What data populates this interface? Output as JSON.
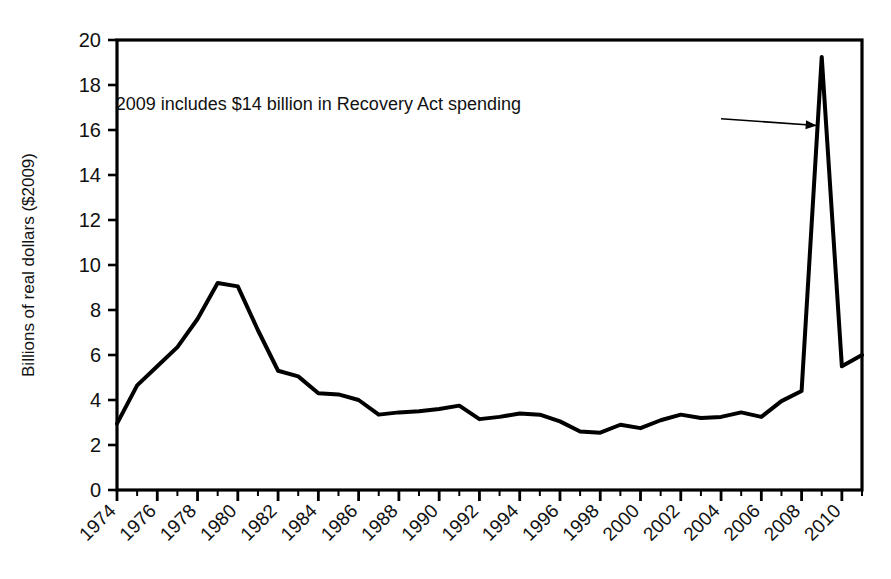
{
  "chart_data": {
    "type": "line",
    "title": "",
    "subtitle": "",
    "xlabel": "",
    "ylabel": "Billions of real dollars ($2009)",
    "xlim": [
      1974,
      2011
    ],
    "ylim": [
      0,
      20
    ],
    "grid": false,
    "legend": null,
    "legend_position": "none",
    "y_ticks": [
      0,
      2,
      4,
      6,
      8,
      10,
      12,
      14,
      16,
      18,
      20
    ],
    "y_tick_labels": [
      "0",
      "2",
      "4",
      "6",
      "8",
      "10",
      "12",
      "14",
      "16",
      "18",
      "20"
    ],
    "y_tick_step": 2,
    "x_ticks": [
      1974,
      1975,
      1976,
      1977,
      1978,
      1979,
      1980,
      1981,
      1982,
      1983,
      1984,
      1985,
      1986,
      1987,
      1988,
      1989,
      1990,
      1991,
      1992,
      1993,
      1994,
      1995,
      1996,
      1997,
      1998,
      1999,
      2000,
      2001,
      2002,
      2003,
      2004,
      2005,
      2006,
      2007,
      2008,
      2009,
      2010,
      2011
    ],
    "x_tick_labels_major": [
      "1974",
      "1976",
      "1978",
      "1980",
      "1982",
      "1984",
      "1986",
      "1988",
      "1990",
      "1992",
      "1994",
      "1996",
      "1998",
      "2000",
      "2002",
      "2004",
      "2006",
      "2008",
      "2010"
    ],
    "x_tick_label_step": 2,
    "x_tick_label_rotation": -45,
    "series": [
      {
        "name": "Real spending",
        "color": "#000000",
        "line_width": 4,
        "x": [
          1974,
          1975,
          1976,
          1977,
          1978,
          1979,
          1980,
          1981,
          1982,
          1983,
          1984,
          1985,
          1986,
          1987,
          1988,
          1989,
          1990,
          1991,
          1992,
          1993,
          1994,
          1995,
          1996,
          1997,
          1998,
          1999,
          2000,
          2001,
          2002,
          2003,
          2004,
          2005,
          2006,
          2007,
          2008,
          2009,
          2010,
          2011
        ],
        "values": [
          2.95,
          4.65,
          5.5,
          6.35,
          7.6,
          9.2,
          9.05,
          7.1,
          5.3,
          5.05,
          4.3,
          4.25,
          4.0,
          3.35,
          3.45,
          3.5,
          3.6,
          3.75,
          3.15,
          3.25,
          3.4,
          3.35,
          3.05,
          2.6,
          2.55,
          2.9,
          2.75,
          3.1,
          3.35,
          3.2,
          3.25,
          3.45,
          3.25,
          3.95,
          4.4,
          19.25,
          5.5,
          6.0
        ]
      }
    ],
    "annotations": [
      {
        "id": "recovery-act-note",
        "text": "2009 includes $14 billion in Recovery Act spending",
        "text_x": 1984.0,
        "text_y": 16.9,
        "arrow_from_x": 2004.0,
        "arrow_from_y": 16.5,
        "arrow_to_x": 2008.75,
        "arrow_to_y": 16.2,
        "has_arrow": true
      }
    ],
    "axis_color": "#000000",
    "background": "#ffffff"
  },
  "figure": {
    "plot_left_px": 117,
    "plot_right_px": 862,
    "plot_top_px": 40,
    "plot_bottom_px": 490
  }
}
